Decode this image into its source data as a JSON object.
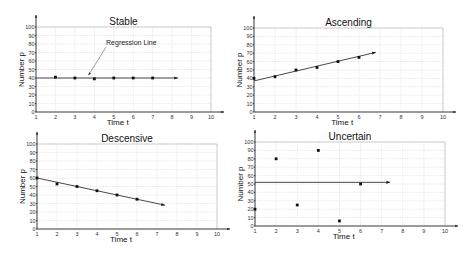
{
  "chart_data": [
    {
      "type": "scatter",
      "title": "Stable",
      "xlabel": "Time t",
      "ylabel": "Number p",
      "xlim": [
        1,
        10
      ],
      "ylim": [
        0,
        100
      ],
      "x_ticks": [
        1,
        2,
        3,
        4,
        5,
        6,
        7,
        8,
        9,
        10
      ],
      "y_ticks": [
        0,
        10,
        20,
        30,
        40,
        50,
        60,
        70,
        80,
        90,
        100
      ],
      "grid": true,
      "points": {
        "x": [
          2,
          3,
          4,
          5,
          6,
          7
        ],
        "y": [
          41,
          40,
          39,
          40,
          40,
          40
        ]
      },
      "regression_line": {
        "x": [
          1,
          8.3
        ],
        "y": [
          40,
          40
        ]
      },
      "annotations": [
        {
          "text": "Regression Line",
          "at": [
            4.5,
            80
          ],
          "points_to": [
            3.7,
            41
          ]
        }
      ],
      "plot_box": {
        "left": 36,
        "right": 211,
        "top": 27,
        "bottom": 112
      }
    },
    {
      "type": "scatter",
      "title": "Ascending",
      "xlabel": "Time t",
      "ylabel": "Number p",
      "xlim": [
        1,
        10
      ],
      "ylim": [
        0,
        100
      ],
      "x_ticks": [
        1,
        2,
        3,
        4,
        5,
        6,
        7,
        8,
        9,
        10
      ],
      "y_ticks": [
        0,
        10,
        20,
        30,
        40,
        50,
        60,
        70,
        80,
        90,
        100
      ],
      "grid": true,
      "points": {
        "x": [
          1,
          2,
          3,
          4,
          5,
          6
        ],
        "y": [
          40,
          42,
          50,
          53,
          60,
          65
        ]
      },
      "regression_line": {
        "x": [
          1,
          6.8
        ],
        "y": [
          37,
          71
        ]
      },
      "annotations": [],
      "plot_box": {
        "left": 254,
        "right": 443,
        "top": 28,
        "bottom": 112
      }
    },
    {
      "type": "scatter",
      "title": "Descensive",
      "xlabel": "Time t",
      "ylabel": "Number p",
      "xlim": [
        1,
        10
      ],
      "ylim": [
        0,
        100
      ],
      "x_ticks": [
        1,
        2,
        3,
        4,
        5,
        6,
        7,
        8,
        9,
        10
      ],
      "y_ticks": [
        0,
        10,
        20,
        30,
        40,
        50,
        60,
        70,
        80,
        90,
        100
      ],
      "grid": true,
      "points": {
        "x": [
          1,
          2,
          3,
          4,
          5,
          6
        ],
        "y": [
          60,
          53,
          50,
          45,
          40,
          35
        ]
      },
      "regression_line": {
        "x": [
          1,
          7.4
        ],
        "y": [
          60,
          28
        ]
      },
      "annotations": [],
      "plot_box": {
        "left": 37,
        "right": 217,
        "top": 144,
        "bottom": 229
      }
    },
    {
      "type": "scatter",
      "title": "Uncertain",
      "xlabel": "Time t",
      "ylabel": "Number p",
      "xlim": [
        1,
        10
      ],
      "ylim": [
        0,
        100
      ],
      "x_ticks": [
        1,
        2,
        3,
        4,
        5,
        6,
        7,
        8,
        9,
        10
      ],
      "y_ticks": [
        0,
        10,
        20,
        30,
        40,
        50,
        60,
        70,
        80,
        90,
        100
      ],
      "grid": true,
      "points": {
        "x": [
          1,
          2,
          3,
          4,
          5,
          6
        ],
        "y": [
          20,
          80,
          25,
          90,
          6,
          50
        ]
      },
      "regression_line": {
        "x": [
          1,
          7.4
        ],
        "y": [
          52,
          52
        ]
      },
      "annotations": [],
      "plot_box": {
        "left": 255,
        "right": 445,
        "top": 142,
        "bottom": 226
      }
    }
  ]
}
